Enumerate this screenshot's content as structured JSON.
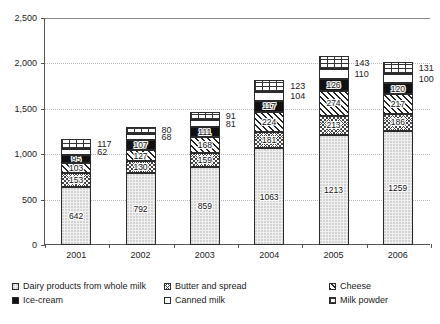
{
  "chart_data": {
    "type": "bar",
    "subtype": "stacked-bar",
    "title": "",
    "xlabel": "",
    "ylabel": "",
    "categories": [
      "2001",
      "2002",
      "2003",
      "2004",
      "2005",
      "2006"
    ],
    "ylim": [
      0,
      2500
    ],
    "ytick_values": [
      0,
      500,
      1000,
      1500,
      2000,
      2500
    ],
    "ytick_labels": [
      "0",
      "500",
      "1,000",
      "1,500",
      "2,000",
      "2,500"
    ],
    "grid": true,
    "legend_position": "bottom",
    "series": [
      {
        "name": "Dairy products from whole milk",
        "pattern": "dots",
        "values": [
          642,
          792,
          859,
          1063,
          1213,
          1259
        ],
        "labels_inside": true
      },
      {
        "name": "Butter and spread",
        "pattern": "crosshatch",
        "values": [
          153,
          130,
          159,
          181,
          213,
          186
        ],
        "labels_inside": true
      },
      {
        "name": "Cheese",
        "pattern": "diagonal",
        "values": [
          103,
          127,
          168,
          224,
          274,
          217
        ],
        "labels_inside": true
      },
      {
        "name": "Ice-cream",
        "pattern": "solid-black",
        "values": [
          95,
          107,
          111,
          117,
          126,
          120
        ],
        "labels_inside": true
      },
      {
        "name": "Canned milk",
        "pattern": "blank",
        "values": [
          62,
          68,
          81,
          104,
          110,
          100
        ],
        "labels_inside": false
      },
      {
        "name": "Milk powder",
        "pattern": "brick",
        "values": [
          117,
          80,
          91,
          123,
          143,
          131
        ],
        "labels_inside": false
      }
    ],
    "totals": [
      1172,
      1304,
      1469,
      1812,
      2079,
      2013
    ]
  },
  "legend": {
    "items": [
      {
        "label": "Dairy products from whole milk",
        "swatch": "dots"
      },
      {
        "label": "Butter and spread",
        "swatch": "crosshatch"
      },
      {
        "label": "Cheese",
        "swatch": "diagonal"
      },
      {
        "label": "Ice-cream",
        "swatch": "solid-black"
      },
      {
        "label": "Canned milk",
        "swatch": "blank"
      },
      {
        "label": "Milk powder",
        "swatch": "brick"
      }
    ]
  },
  "colors": {
    "axis": "#555555",
    "gridline": "#b9b9b9",
    "text": "#1a1a1a",
    "background": "#ffffff"
  }
}
